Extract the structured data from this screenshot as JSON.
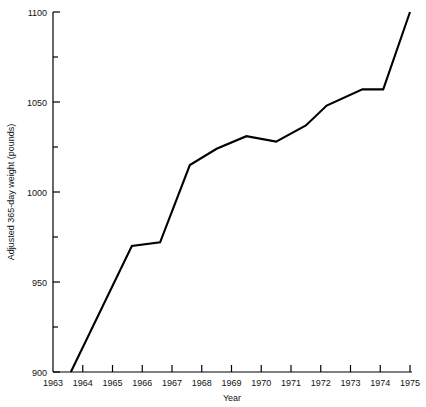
{
  "chart_data": {
    "type": "line",
    "title": "",
    "xlabel": "Year",
    "ylabel": "Adjusted 365-day weight (pounds)",
    "xlim": [
      1963,
      1975
    ],
    "ylim": [
      900,
      1100
    ],
    "grid": false,
    "legend": null,
    "x_ticks": [
      "1963",
      "1964",
      "1965",
      "1966",
      "1967",
      "1968",
      "1969",
      "1970",
      "1971",
      "1972",
      "1973",
      "1974",
      "1975"
    ],
    "y_ticks": [
      "900",
      "950",
      "1000",
      "1050",
      "1100"
    ],
    "y_minor_ticks": [
      925,
      975,
      1025,
      1075
    ],
    "x": [
      1963.6,
      1965.65,
      1966.6,
      1967.6,
      1968.5,
      1969.5,
      1970.5,
      1971.5,
      1972.2,
      1973.4,
      1974.1,
      1975
    ],
    "values": [
      900,
      970,
      972,
      1015,
      1024,
      1031,
      1028,
      1037,
      1048,
      1057,
      1057,
      1100
    ],
    "line_color": "#000000",
    "series": [
      {
        "name": "Adjusted 365-day weight",
        "points": [
          {
            "year": 1963.6,
            "weight": 900
          },
          {
            "year": 1965.65,
            "weight": 970
          },
          {
            "year": 1966.6,
            "weight": 972
          },
          {
            "year": 1967.6,
            "weight": 1015
          },
          {
            "year": 1968.5,
            "weight": 1024
          },
          {
            "year": 1969.5,
            "weight": 1031
          },
          {
            "year": 1970.5,
            "weight": 1028
          },
          {
            "year": 1971.5,
            "weight": 1037
          },
          {
            "year": 1972.2,
            "weight": 1048
          },
          {
            "year": 1973.4,
            "weight": 1057
          },
          {
            "year": 1974.1,
            "weight": 1057
          },
          {
            "year": 1975.0,
            "weight": 1100
          }
        ]
      }
    ]
  }
}
